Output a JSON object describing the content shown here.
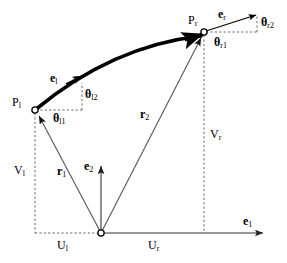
{
  "figure": {
    "type": "geometric-vector-diagram",
    "width": 287,
    "height": 263,
    "background_color": "#ffffff",
    "line_color": "#555555",
    "curve_color": "#000000",
    "text_color": "#000000"
  },
  "labels": {
    "point_left": {
      "base": "P",
      "sub": "l"
    },
    "point_right": {
      "base": "P",
      "sub": "r"
    },
    "e_left": {
      "base": "e",
      "sub": "l"
    },
    "e_right": {
      "base": "e",
      "sub": "r"
    },
    "e_one": {
      "base": "e",
      "sub": "1"
    },
    "e_two": {
      "base": "e",
      "sub": "2"
    },
    "r_one": {
      "base": "r",
      "sub": "1"
    },
    "r_two": {
      "base": "r",
      "sub": "2"
    },
    "theta_l1": {
      "base": "θ",
      "sub": "l1"
    },
    "theta_l2": {
      "base": "θ",
      "sub": "l2"
    },
    "theta_r1": {
      "base": "θ",
      "sub": "r1"
    },
    "theta_r2": {
      "base": "θ",
      "sub": "r2"
    },
    "u_left": {
      "base": "U",
      "sub": "l"
    },
    "u_right": {
      "base": "U",
      "sub": "r"
    },
    "v_left": {
      "base": "V",
      "sub": "l"
    },
    "v_right": {
      "base": "V",
      "sub": "r"
    }
  },
  "geometry": {
    "origin": {
      "x": 101,
      "y": 233
    },
    "point_left": {
      "x": 35,
      "y": 110
    },
    "point_right": {
      "x": 204,
      "y": 32
    },
    "e1_tip": {
      "x": 265,
      "y": 233
    },
    "e2_tip": {
      "x": 101,
      "y": 163
    },
    "curve_control": {
      "x": 110,
      "y": 45
    }
  }
}
